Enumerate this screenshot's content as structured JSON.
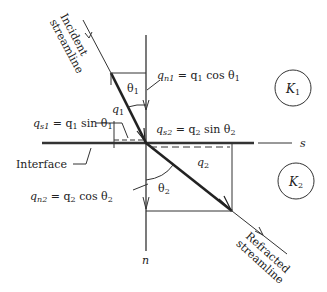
{
  "diagram": {
    "incident_label": [
      "Incident",
      "streamline"
    ],
    "refracted_label": [
      "Refracted",
      "streamline"
    ],
    "interface_label": "Interface",
    "axis_s": "s",
    "axis_n": "n",
    "theta1": "θ",
    "theta1_sub": "1",
    "theta2": "θ",
    "theta2_sub": "2",
    "q1": "q",
    "q1_sub": "1",
    "q2": "q",
    "q2_sub": "2",
    "k1": "K",
    "k1_sub": "1",
    "k2": "K",
    "k2_sub": "2",
    "eq_qn1": {
      "lhs": "q",
      "lhs_sub": "n1",
      "rhs": " = q",
      "rhs_sub": "1",
      "tail": " cos θ",
      "tail_sub": "1"
    },
    "eq_qs1": {
      "lhs": "q",
      "lhs_sub": "s1",
      "rhs": " = q",
      "rhs_sub": "1",
      "tail": " sin θ",
      "tail_sub": "1"
    },
    "eq_qs2": {
      "lhs": "q",
      "lhs_sub": "s2",
      "rhs": " = q",
      "rhs_sub": "2",
      "tail": " sin θ",
      "tail_sub": "2"
    },
    "eq_qn2": {
      "lhs": "q",
      "lhs_sub": "n2",
      "rhs": " = q",
      "rhs_sub": "2",
      "tail": " cos θ",
      "tail_sub": "2"
    }
  }
}
